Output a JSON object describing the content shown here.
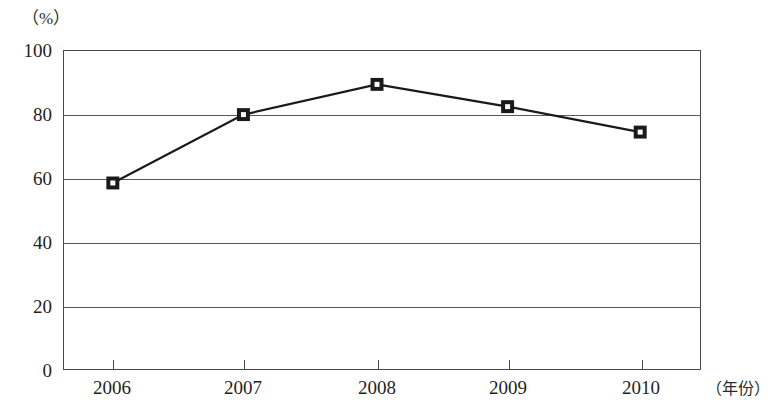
{
  "chart_data": {
    "type": "line",
    "title": "",
    "subtitle": "",
    "xlabel": "（年份）",
    "ylabel": "（%）",
    "categories": [
      "2006",
      "2007",
      "2008",
      "2009",
      "2010"
    ],
    "x": [
      2006,
      2007,
      2008,
      2009,
      2010
    ],
    "values": [
      58.5,
      80.0,
      89.5,
      82.5,
      74.5
    ],
    "series": [
      {
        "name": "",
        "values": [
          58.5,
          80.0,
          89.5,
          82.5,
          74.5
        ]
      }
    ],
    "ylim": [
      0,
      100
    ],
    "y_ticks": [
      0,
      20,
      40,
      60,
      80,
      100
    ],
    "y_tick_labels": [
      "0",
      "20",
      "40",
      "60",
      "80",
      "100"
    ],
    "x_tick_labels": [
      "2006",
      "2007",
      "2008",
      "2009",
      "2010"
    ],
    "grid": true,
    "grid_axis": "y",
    "legend": false,
    "legend_position": "none",
    "marker": "square",
    "marker_style": "filled-black-with-white-center",
    "line_color": "#1a1a1a",
    "marker_color": "#1a1a1a",
    "marker_fill": "#ffffff",
    "grid_color": "#5a5a5a",
    "frame_color": "#4a4a4a",
    "background": "#ffffff"
  },
  "layout": {
    "plot": {
      "left": 63,
      "top": 50,
      "right": 701,
      "bottom": 370,
      "width": 638,
      "height": 320
    }
  }
}
